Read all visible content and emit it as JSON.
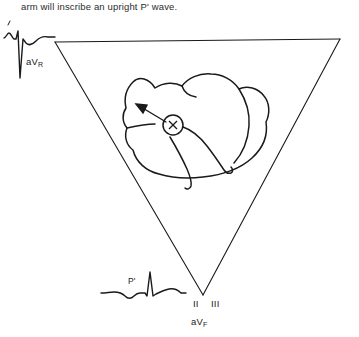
{
  "figure": {
    "caption": "arm will inscribe an upright P' wave.",
    "background_color": "#ffffff",
    "line_color": "#1a1a1a"
  },
  "triangle": {
    "name": "einthoven-triangle",
    "vertices": {
      "left": {
        "x": 55,
        "y": 42
      },
      "right": {
        "x": 340,
        "y": 39
      },
      "bottom": {
        "x": 203,
        "y": 295
      }
    }
  },
  "heart": {
    "name": "heart-outline",
    "focus_marker": {
      "label": "X",
      "cx": 173,
      "cy": 125,
      "r": 10
    },
    "arrow": {
      "name": "depolarization-arrow",
      "from": {
        "x": 166,
        "y": 122
      },
      "to": {
        "x": 139,
        "y": 106
      },
      "direction": "up-left toward aVR"
    }
  },
  "labels": {
    "avr": {
      "text": "aV",
      "subscript": "R"
    },
    "avf": {
      "text": "aV",
      "subscript": "F"
    },
    "lead_ii": "II",
    "lead_iii": "III",
    "p_prime": "P'"
  },
  "ecg_traces": [
    {
      "name": "avr-trace",
      "lead": "aVR",
      "position": "top-left",
      "description": "small P wave, deep negative QRS, rounded T wave",
      "p_wave_polarity": "positive",
      "qrs_polarity": "negative"
    },
    {
      "name": "p-prime-trace",
      "lead": "inferior",
      "position": "bottom-left",
      "description": "inverted P' wave, tall narrow QRS, rounded T wave",
      "p_wave_polarity": "inverted",
      "qrs_polarity": "positive",
      "annotation": "P'"
    }
  ]
}
